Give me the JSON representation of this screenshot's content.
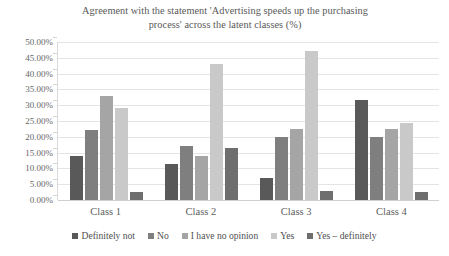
{
  "chart_data": {
    "type": "bar",
    "title": "Agreement with the statement 'Advertising speeds up the purchasing process' across the latent classes (%)",
    "title_lines": [
      "Agreement with the statement 'Advertising speeds up the purchasing",
      "process' across the latent classes (%)"
    ],
    "xlabel": "",
    "ylabel": "",
    "ylim": [
      0,
      50
    ],
    "ytick_step": 5,
    "grid": true,
    "legend_position": "bottom",
    "categories": [
      "Class 1",
      "Class 2",
      "Class 3",
      "Class 4"
    ],
    "ytick_labels": [
      "50.00%",
      "45.00%",
      "40.00%",
      "35.00%",
      "30.00%",
      "25.00%",
      "20.00%",
      "15.00%",
      "10.00%",
      "5.00%",
      "0.00%"
    ],
    "ytick_values": [
      50,
      45,
      40,
      35,
      30,
      25,
      20,
      15,
      10,
      5,
      0
    ],
    "series": [
      {
        "name": "Definitely not",
        "color": "#595959",
        "values": [
          14.0,
          11.5,
          7.0,
          31.5
        ]
      },
      {
        "name": "No",
        "color": "#7f7f7f",
        "values": [
          22.0,
          17.0,
          20.0,
          20.0
        ]
      },
      {
        "name": "I have no opinion",
        "color": "#a5a5a5",
        "values": [
          33.0,
          14.0,
          22.5,
          22.5
        ]
      },
      {
        "name": "Yes",
        "color": "#c9c9c9",
        "values": [
          29.0,
          43.0,
          47.0,
          24.5
        ]
      },
      {
        "name": "Yes – definitely",
        "color": "#6e6e6e",
        "values": [
          2.5,
          16.5,
          3.0,
          2.5
        ]
      }
    ]
  },
  "colors": {
    "background": "#ffffff",
    "gridline": "#e4e4e4",
    "axis": "#d9d9d9",
    "text": "#595959"
  }
}
